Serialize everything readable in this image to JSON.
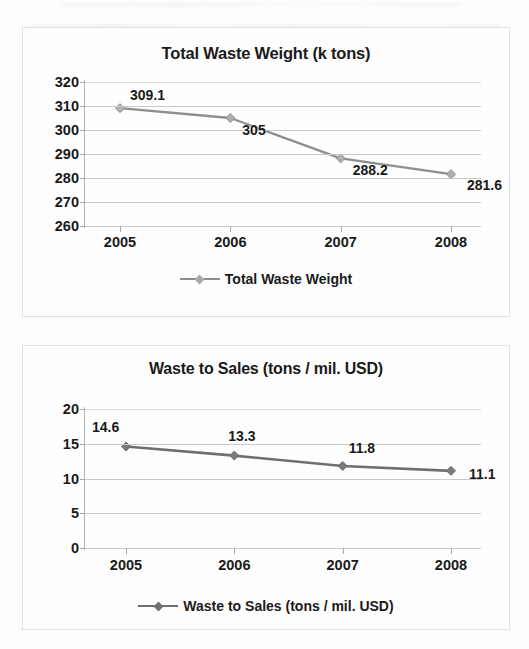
{
  "page": {
    "background_color": "#fdfdfd",
    "text_color": "#1a1a1a"
  },
  "chart_data": [
    {
      "type": "line",
      "title": "Total Waste Weight (k tons)",
      "xlabel": "",
      "ylabel": "",
      "categories": [
        "2005",
        "2006",
        "2007",
        "2008"
      ],
      "values": [
        309.1,
        305,
        288.2,
        281.6
      ],
      "point_labels": [
        "309.1",
        "305",
        "288.2",
        "281.6"
      ],
      "ylim": [
        260,
        320
      ],
      "yticks": [
        320,
        310,
        300,
        290,
        280,
        270,
        260
      ],
      "ytick_labels": [
        "320",
        "310",
        "300",
        "290",
        "280",
        "270",
        "260"
      ],
      "grid": true,
      "legend_position": "bottom",
      "legend": [
        "Total Waste Weight"
      ],
      "series_color": "#8e8e8e",
      "marker": "diamond"
    },
    {
      "type": "line",
      "title": "Waste to Sales (tons / mil. USD)",
      "xlabel": "",
      "ylabel": "",
      "categories": [
        "2005",
        "2006",
        "2007",
        "2008"
      ],
      "values": [
        14.6,
        13.3,
        11.8,
        11.1
      ],
      "point_labels": [
        "14.6",
        "13.3",
        "11.8",
        "11.1"
      ],
      "ylim": [
        0,
        20
      ],
      "yticks": [
        20,
        15,
        10,
        5,
        0
      ],
      "ytick_labels": [
        "20",
        "15",
        "10",
        "5",
        "0"
      ],
      "grid": true,
      "legend_position": "bottom",
      "legend": [
        "Waste to Sales (tons / mil. USD)"
      ],
      "series_color": "#6f6f6f",
      "marker": "diamond"
    }
  ]
}
